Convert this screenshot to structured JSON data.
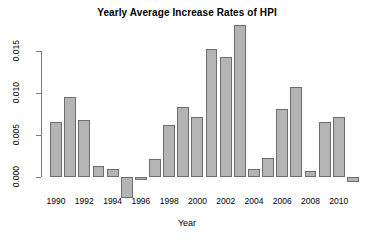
{
  "chart_data": {
    "type": "bar",
    "title": "Yearly Average Increase Rates of HPI",
    "xlabel": "Year",
    "ylabel": "",
    "categories": [
      1990,
      1991,
      1992,
      1993,
      1994,
      1995,
      1996,
      1997,
      1998,
      1999,
      2000,
      2001,
      2002,
      2003,
      2004,
      2005,
      2006,
      2007,
      2008,
      2009,
      2010,
      2011
    ],
    "values": [
      0.0065,
      0.0095,
      0.0068,
      0.0013,
      0.0009,
      -0.0025,
      -0.0004,
      0.0022,
      0.0062,
      0.0083,
      0.0072,
      0.0152,
      0.0143,
      0.0181,
      0.001,
      0.0023,
      0.0081,
      0.0107,
      0.0007,
      0.0065,
      0.0072,
      -0.0006
    ],
    "ylim": [
      -0.003,
      0.019
    ],
    "yticks": [
      0.0,
      0.005,
      0.01,
      0.015
    ],
    "ytick_labels": [
      "0.000",
      "0.005",
      "0.010",
      "0.015"
    ],
    "xtick_labels": [
      "1990",
      "1992",
      "1994",
      "1996",
      "1998",
      "2000",
      "2002",
      "2004",
      "2006",
      "2008",
      "2010"
    ],
    "xticks": [
      1990,
      1992,
      1994,
      1996,
      1998,
      2000,
      2002,
      2004,
      2006,
      2008,
      2010
    ],
    "grid": false,
    "legend": null,
    "bar_fill_color": "#b4b4b4",
    "bar_border_color": "#6e6e6e",
    "axis_color": "#7a7a7a",
    "background_color": "#ffffff"
  }
}
